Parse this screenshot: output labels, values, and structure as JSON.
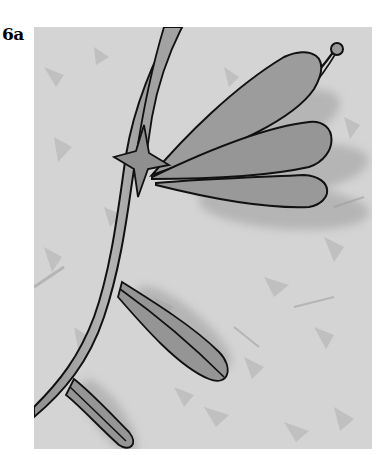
{
  "figure": {
    "label": "6a",
    "colors": {
      "background": "#d4d4d4",
      "paper_flecks": "#b8b8b8",
      "leaf_fill": "#9a9a9a",
      "stem_fill": "#a8a8a8",
      "outline": "#111111",
      "page": "#ffffff"
    },
    "elements": {
      "stem": "stem",
      "star_node": "star",
      "upper_leaves": [
        "upper-leaf-1",
        "upper-leaf-2",
        "upper-leaf-3"
      ],
      "tendril": "tendril with bud",
      "lower_leaves": [
        "middle-leaf",
        "bottom-leaf"
      ]
    }
  }
}
